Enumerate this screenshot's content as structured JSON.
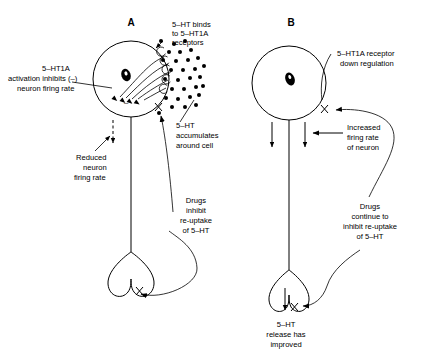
{
  "figure": {
    "title": "",
    "type": "scientific-diagram"
  },
  "panels": [
    {
      "id": "A",
      "label": "A",
      "annotations": [
        {
          "name": "ht-binds-receptors",
          "lines": [
            "5–HT binds",
            "to 5–HT1A",
            "receptors"
          ],
          "align": "left"
        },
        {
          "name": "ht1a-activation-inhibits",
          "lines": [
            "5–HT1A",
            "activation inhibits (–)",
            "neuron firing rate"
          ],
          "align": "center"
        },
        {
          "name": "ht-accumulates",
          "lines": [
            "5–HT",
            "accumulates",
            "around cell"
          ],
          "align": "left"
        },
        {
          "name": "reduced-firing-rate",
          "lines": [
            "Reduced",
            "neuron",
            "firing rate"
          ],
          "align": "center"
        },
        {
          "name": "drugs-inhibit-reuptake",
          "lines": [
            "Drugs",
            "inhibit",
            "re-uptake",
            "of 5–HT"
          ],
          "align": "center"
        }
      ],
      "symbols": {
        "minus_sign": "–",
        "blocked_marker": "X"
      }
    },
    {
      "id": "B",
      "label": "B",
      "annotations": [
        {
          "name": "receptor-down-regulation",
          "lines": [
            "5–HT1A receptor",
            "down regulation"
          ],
          "align": "left"
        },
        {
          "name": "increased-firing-rate",
          "lines": [
            "Increased",
            "firing rate",
            "of neuron"
          ],
          "align": "left"
        },
        {
          "name": "drugs-continue-inhibit",
          "lines": [
            "Drugs",
            "continue to",
            "inhibit re-uptake",
            "of 5–HT"
          ],
          "align": "center"
        },
        {
          "name": "ht-release-improved",
          "lines": [
            "5–HT",
            "release has",
            "improved"
          ],
          "align": "center"
        }
      ],
      "symbols": {
        "blocked_marker": "X"
      }
    }
  ],
  "colors": {
    "ink": "#000000",
    "background": "#ffffff"
  }
}
